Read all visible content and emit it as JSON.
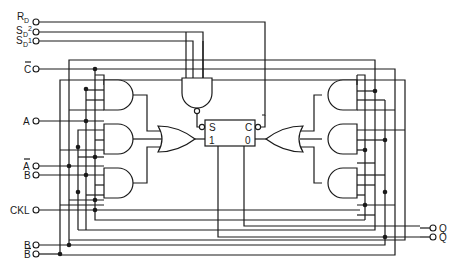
{
  "diagram": {
    "type": "logic-circuit",
    "inputs": [
      {
        "id": "rd",
        "label": "R",
        "sub": "D",
        "sup": ""
      },
      {
        "id": "sd2",
        "label": "S",
        "sub": "D",
        "sup": "2"
      },
      {
        "id": "sd1",
        "label": "S",
        "sub": "D",
        "sup": "1"
      },
      {
        "id": "cbar",
        "label": "C",
        "overbar": true
      },
      {
        "id": "a",
        "label": "A"
      },
      {
        "id": "abar",
        "label": "A",
        "overbar": true
      },
      {
        "id": "b1",
        "label": "B"
      },
      {
        "id": "ckl",
        "label": "CKL"
      },
      {
        "id": "b2",
        "label": "B"
      },
      {
        "id": "bbar",
        "label": "B",
        "overbar": true
      }
    ],
    "outputs": [
      {
        "id": "q",
        "label": "Q"
      },
      {
        "id": "qbar",
        "label": "Q"
      }
    ],
    "flipflop": {
      "set_label": "S",
      "clear_label": "C",
      "one_label": "1",
      "zero_label": "0"
    }
  }
}
